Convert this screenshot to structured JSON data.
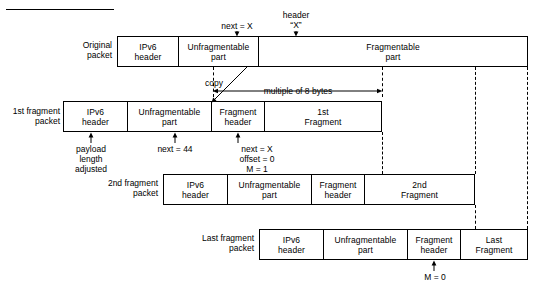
{
  "diagram": {
    "title_rule": "",
    "rows": [
      {
        "id": "original",
        "label_line1": "Original",
        "label_line2": "packet",
        "cells": [
          {
            "line1": "IPv6",
            "line2": "header"
          },
          {
            "line1": "Unfragmentable",
            "line2": "part"
          },
          {
            "line1": "Fragmentable",
            "line2": "part"
          }
        ]
      },
      {
        "id": "first-fragment",
        "label_line1": "1st fragment",
        "label_line2": "packet",
        "cells": [
          {
            "line1": "IPv6",
            "line2": "header"
          },
          {
            "line1": "Unfragmentable",
            "line2": "part"
          },
          {
            "line1": "Fragment",
            "line2": "header"
          },
          {
            "line1": "1st",
            "line2": "Fragment"
          }
        ]
      },
      {
        "id": "second-fragment",
        "label_line1": "2nd fragment",
        "label_line2": "packet",
        "cells": [
          {
            "line1": "IPv6",
            "line2": "header"
          },
          {
            "line1": "Unfragmentable",
            "line2": "part"
          },
          {
            "line1": "Fragment",
            "line2": "header"
          },
          {
            "line1": "2nd",
            "line2": "Fragment"
          }
        ]
      },
      {
        "id": "last-fragment",
        "label_line1": "Last fragment",
        "label_line2": "packet",
        "cells": [
          {
            "line1": "IPv6",
            "line2": "header"
          },
          {
            "line1": "Unfragmentable",
            "line2": "part"
          },
          {
            "line1": "Fragment",
            "line2": "header"
          },
          {
            "line1": "Last",
            "line2": "Fragment"
          }
        ]
      }
    ],
    "annotations": {
      "next_x_top": "next = X",
      "header_x_line1": "header",
      "header_x_line2": "“X”",
      "copy": "copy",
      "multiple_of_8": "multiple of 8 bytes",
      "payload_len_line1": "payload",
      "payload_len_line2": "length",
      "payload_len_line3": "adjusted",
      "next_44": "next = 44",
      "frag_hdr_line1": "next = X",
      "frag_hdr_line2": "offset = 0",
      "frag_hdr_line3": "M = 1",
      "m_zero": "M = 0"
    }
  }
}
